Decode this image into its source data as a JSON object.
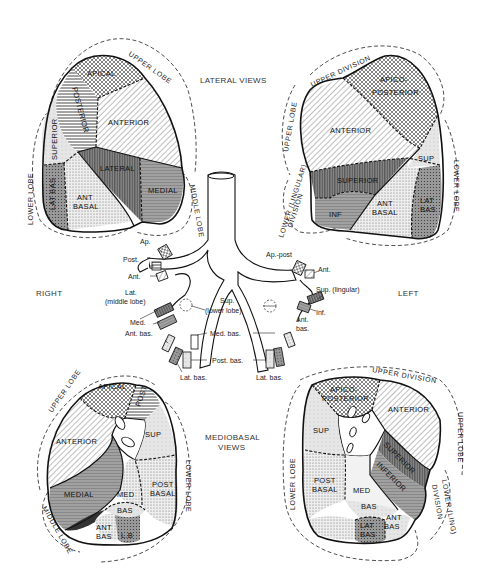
{
  "titles": {
    "lateral": "LATERAL VIEWS",
    "mediobasal_line1": "MEDIOBASAL",
    "mediobasal_line2": "VIEWS",
    "right": "RIGHT",
    "left": "LEFT"
  },
  "lateral_right": {
    "lobes": {
      "upper": "UPPER LOBE",
      "middle": "MIDDLE LOBE",
      "lower": "LOWER LOBE"
    },
    "segments": {
      "apical": "APICAL",
      "posterior": "POSTERIOR",
      "anterior": "ANTERIOR",
      "superior": "SUPERIOR",
      "lateral": "LATERAL",
      "medial": "MEDIAL",
      "lat_bas": "LAT BAS",
      "ant_basal_1": "ANT",
      "ant_basal_2": "BASAL"
    }
  },
  "lateral_left": {
    "lobes": {
      "upper_division": "UPPER DIVISION",
      "upper": "UPPER LOBE",
      "lower_lingular": "LOWER (LINGULAR)",
      "division": "DIVISION",
      "lower": "LOWER LOBE"
    },
    "segments": {
      "apico_1": "APICO-",
      "apico_2": "POSTERIOR",
      "anterior": "ANTERIOR",
      "sup": "SUP",
      "superior": "SUPERIOR",
      "inf": "INF",
      "ant_basal_1": "ANT",
      "ant_basal_2": "BASAL",
      "lat_bas_1": "LAT",
      "lat_bas_2": "BAS"
    }
  },
  "bronchi": {
    "right": {
      "ap": "Ap.",
      "post": "Post.",
      "ant": "Ant.",
      "lat_1": "Lat.",
      "lat_2": "(middle lobe)",
      "med": "Med.",
      "ant_bas": "Ant. bas.",
      "lat_bas": "Lat. bas."
    },
    "center": {
      "sup_1": "Sup.",
      "sup_2": "(lower lobe)",
      "med_bas": "Med. bas.",
      "post_bas": "Post. bas."
    },
    "left": {
      "ap_post": "Ap.-post",
      "ant": "Ant.",
      "sup_lingular": "Sup. (lingular)",
      "inf": "Inf.",
      "ant_bas_1": "Ant.",
      "ant_bas_2": "bas.",
      "lat_bas": "Lat. bas."
    }
  },
  "mediobasal_right": {
    "lobes": {
      "upper": "UPPER LOBE",
      "middle": "MIDDLE LOBE",
      "lower": "LOWER LOBE"
    },
    "segments": {
      "apical": "APICAL",
      "post": "POST",
      "anterior": "ANTERIOR",
      "sup": "SUP",
      "medial": "MEDIAL",
      "med": "MED",
      "bas": "BAS",
      "post_basal_1": "POST",
      "post_basal_2": "BASAL",
      "ant_bas_1": "ANT",
      "ant_bas_2": "BAS",
      "lb": "L.B"
    }
  },
  "mediobasal_left": {
    "lobes": {
      "upper_division": "UPPER DIVISION",
      "upper": "UPPER LOBE",
      "lower_lingual": "LOWER (LING)",
      "division": "DIVISION",
      "lower": "LOWER LOBE"
    },
    "segments": {
      "apico_1": "APICO-",
      "apico_2": "POSTERIOR",
      "anterior": "ANTERIOR",
      "sup": "SUP",
      "superior": "SUPERIOR",
      "inferior": "INFERIOR",
      "post_basal_1": "POST",
      "post_basal_2": "BASAL",
      "med": "MED",
      "bas": "BAS",
      "lat_bas_1": "LAT",
      "lat_bas_2": "BAS",
      "ant_bas_1": "ANT",
      "ant_bas_2": "BAS"
    }
  }
}
